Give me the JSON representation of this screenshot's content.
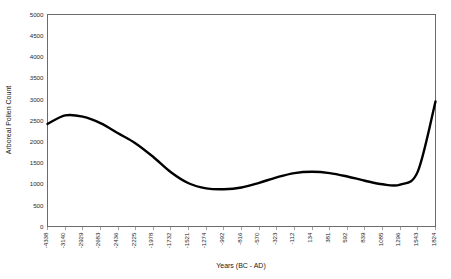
{
  "chart_data": {
    "type": "line",
    "title": "",
    "xlabel": "Years (BC - AD)",
    "ylabel": "Arboreal Pollen Count",
    "ylim": [
      0,
      5000
    ],
    "yticks": [
      0,
      500,
      1000,
      1500,
      2000,
      2500,
      3000,
      3500,
      4000,
      4500,
      5000
    ],
    "ytick_labels": [
      "0",
      "500",
      "1000",
      "1500",
      "2000",
      "2500",
      "3000",
      "3500",
      "4000",
      "4500",
      "5000"
    ],
    "grid": false,
    "legend": "none",
    "categories": [
      "-4338",
      "-3140",
      "-2929",
      "-2683",
      "-2436",
      "-2225",
      "-1978",
      "-1732",
      "-1521",
      "-1274",
      "-992",
      "-816",
      "-570",
      "-323",
      "-112",
      "134",
      "381",
      "592",
      "839",
      "1085",
      "1296",
      "1543",
      "1824"
    ],
    "series": [
      {
        "name": "Arboreal Pollen Count",
        "values": [
          2420,
          2620,
          2590,
          2440,
          2200,
          1960,
          1640,
          1280,
          1020,
          900,
          880,
          920,
          1030,
          1160,
          1260,
          1290,
          1260,
          1180,
          1080,
          995,
          990,
          1300,
          2950
        ]
      }
    ]
  },
  "axes": {
    "x_title": "Years (BC - AD)",
    "y_title": "Arboreal Pollen Count"
  }
}
